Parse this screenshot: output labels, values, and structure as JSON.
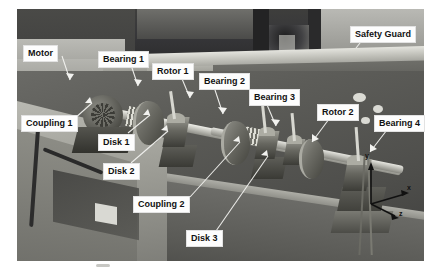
{
  "figure": {
    "kind": "photograph",
    "palette": {
      "label_bg": "#fdfdfd",
      "label_text": "#111111",
      "leader_line": "#f2f2ef"
    }
  },
  "annotations": [
    {
      "id": "motor",
      "label": "Motor",
      "x": 23,
      "y": 45,
      "target_x": 62,
      "target_y": 78
    },
    {
      "id": "bearing-1",
      "label": "Bearing 1",
      "x": 98,
      "y": 51,
      "target_x": 128,
      "target_y": 86
    },
    {
      "id": "rotor-1",
      "label": "Rotor 1",
      "x": 152,
      "y": 63,
      "target_x": 178,
      "target_y": 96
    },
    {
      "id": "bearing-2",
      "label": "Bearing 2",
      "x": 199,
      "y": 73,
      "target_x": 220,
      "target_y": 112
    },
    {
      "id": "bearing-3",
      "label": "Bearing 3",
      "x": 249,
      "y": 89,
      "target_x": 268,
      "target_y": 124
    },
    {
      "id": "rotor-2",
      "label": "Rotor 2",
      "x": 317,
      "y": 104,
      "target_x": 300,
      "target_y": 140
    },
    {
      "id": "bearing-4",
      "label": "Bearing 4",
      "x": 374,
      "y": 115,
      "target_x": 352,
      "target_y": 150
    },
    {
      "id": "safety-guard",
      "label": "Safety Guard",
      "x": 350,
      "y": 26,
      "target_x": 350,
      "target_y": 46
    },
    {
      "id": "coupling-1",
      "label": "Coupling 1",
      "x": 21,
      "y": 115,
      "target_x": 86,
      "target_y": 99
    },
    {
      "id": "disk-1",
      "label": "Disk 1",
      "x": 98,
      "y": 134,
      "target_x": 142,
      "target_y": 112
    },
    {
      "id": "disk-2",
      "label": "Disk 2",
      "x": 103,
      "y": 163,
      "target_x": 160,
      "target_y": 128
    },
    {
      "id": "coupling-2",
      "label": "Coupling 2",
      "x": 133,
      "y": 196,
      "target_x": 230,
      "target_y": 140
    },
    {
      "id": "disk-3",
      "label": "Disk 3",
      "x": 186,
      "y": 230,
      "target_x": 262,
      "target_y": 152
    }
  ],
  "axes_widget": {
    "name": "coordinate-axes",
    "labels": {
      "x": "x",
      "y": "y",
      "z": "z"
    }
  }
}
